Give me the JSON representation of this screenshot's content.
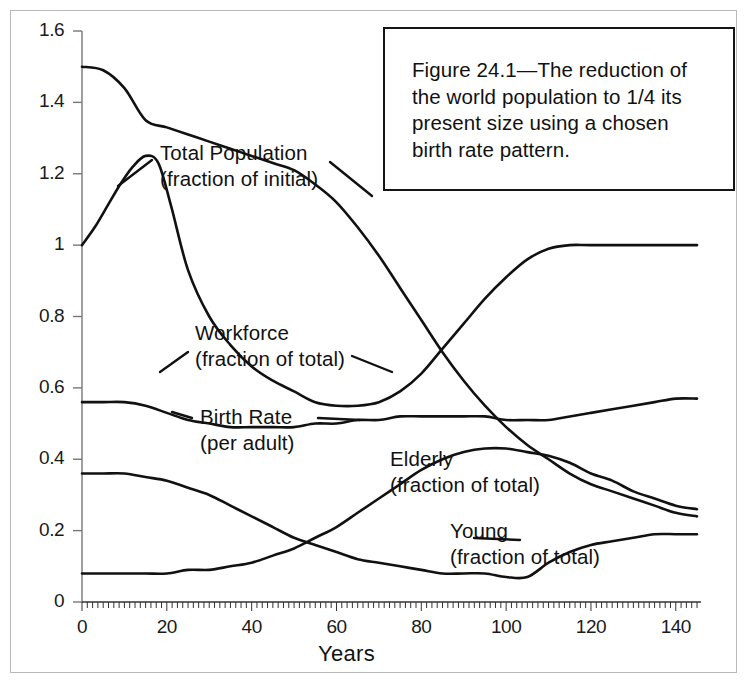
{
  "figure": {
    "caption_line1": "Figure 24.1—The reduction of",
    "caption_line2": "the world population to 1/4 its",
    "caption_line3": "present size using a chosen",
    "caption_line4": "birth rate pattern."
  },
  "annotations": [
    {
      "name": "total-population",
      "line1": "Total Population",
      "line2": "(fraction of initial)",
      "x": 160,
      "y": 140
    },
    {
      "name": "workforce",
      "line1": "Workforce",
      "line2": "(fraction of total)",
      "x": 195,
      "y": 320
    },
    {
      "name": "birth-rate",
      "line1": "Birth Rate",
      "line2": "(per adult)",
      "x": 200,
      "y": 404
    },
    {
      "name": "elderly",
      "line1": "Elderly",
      "line2": "(fraction of total)",
      "x": 390,
      "y": 446
    },
    {
      "name": "young",
      "line1": "Young",
      "line2": "(fraction of total)",
      "x": 450,
      "y": 518
    }
  ],
  "chart_data": {
    "type": "line",
    "title": "",
    "xlabel": "Years",
    "ylabel": "",
    "xlim": [
      0,
      145
    ],
    "ylim": [
      0,
      1.6
    ],
    "xticks": [
      0,
      20,
      40,
      60,
      80,
      100,
      120,
      140
    ],
    "yticks": [
      0,
      0.2,
      0.4,
      0.6,
      0.8,
      1,
      1.2,
      1.4,
      1.6
    ],
    "ytick_labels": [
      "0",
      "0.2",
      "0.4",
      "0.6",
      "0.8",
      "1",
      "1.2",
      "1.4",
      "1.6"
    ],
    "xtick_labels": [
      "0",
      "20",
      "40",
      "60",
      "80",
      "100",
      "120",
      "140"
    ],
    "grid": false,
    "legend": "inline-annotations",
    "line_color": "#111111",
    "series": [
      {
        "name": "Total Population (fraction of initial)",
        "x": [
          0,
          5,
          10,
          15,
          20,
          25,
          30,
          35,
          40,
          45,
          50,
          55,
          60,
          65,
          70,
          75,
          80,
          85,
          90,
          95,
          100,
          105,
          110,
          115,
          120,
          125,
          130,
          135,
          140,
          145
        ],
        "values": [
          1.5,
          1.49,
          1.44,
          1.35,
          1.33,
          1.31,
          1.29,
          1.27,
          1.25,
          1.23,
          1.21,
          1.17,
          1.12,
          1.05,
          0.97,
          0.88,
          0.79,
          0.7,
          0.62,
          0.55,
          0.49,
          0.44,
          0.4,
          0.36,
          0.33,
          0.31,
          0.29,
          0.27,
          0.25,
          0.24
        ]
      },
      {
        "name": "Birth Rate (per adult)",
        "x": [
          0,
          3,
          6,
          9,
          12,
          15,
          18,
          21,
          25,
          30,
          35,
          40,
          45,
          50,
          55,
          60,
          65,
          70,
          75,
          80,
          85,
          90,
          95,
          100,
          105,
          110,
          115,
          120,
          130,
          140,
          145
        ],
        "values": [
          1.0,
          1.05,
          1.11,
          1.17,
          1.22,
          1.25,
          1.23,
          1.11,
          0.93,
          0.8,
          0.72,
          0.66,
          0.62,
          0.59,
          0.56,
          0.55,
          0.55,
          0.56,
          0.59,
          0.64,
          0.71,
          0.78,
          0.85,
          0.91,
          0.96,
          0.99,
          1.0,
          1.0,
          1.0,
          1.0,
          1.0
        ]
      },
      {
        "name": "Workforce (fraction of total)",
        "x": [
          0,
          5,
          10,
          15,
          20,
          25,
          30,
          35,
          40,
          45,
          50,
          55,
          60,
          65,
          70,
          75,
          80,
          85,
          90,
          95,
          100,
          105,
          110,
          115,
          120,
          125,
          130,
          135,
          140,
          145
        ],
        "values": [
          0.56,
          0.56,
          0.56,
          0.55,
          0.53,
          0.51,
          0.5,
          0.49,
          0.49,
          0.49,
          0.49,
          0.5,
          0.5,
          0.51,
          0.51,
          0.52,
          0.52,
          0.52,
          0.52,
          0.52,
          0.51,
          0.51,
          0.51,
          0.52,
          0.53,
          0.54,
          0.55,
          0.56,
          0.57,
          0.57
        ]
      },
      {
        "name": "Elderly (fraction of total)",
        "x": [
          0,
          5,
          10,
          15,
          20,
          25,
          30,
          35,
          40,
          45,
          50,
          55,
          60,
          65,
          70,
          75,
          80,
          85,
          90,
          95,
          100,
          105,
          110,
          115,
          120,
          125,
          130,
          135,
          140,
          145
        ],
        "values": [
          0.08,
          0.08,
          0.08,
          0.08,
          0.08,
          0.09,
          0.09,
          0.1,
          0.11,
          0.13,
          0.15,
          0.18,
          0.21,
          0.25,
          0.29,
          0.33,
          0.37,
          0.4,
          0.42,
          0.43,
          0.43,
          0.42,
          0.41,
          0.39,
          0.36,
          0.34,
          0.31,
          0.29,
          0.27,
          0.26
        ]
      },
      {
        "name": "Young (fraction of total)",
        "x": [
          0,
          5,
          10,
          15,
          20,
          25,
          30,
          35,
          40,
          45,
          50,
          55,
          60,
          65,
          70,
          75,
          80,
          85,
          90,
          95,
          100,
          105,
          110,
          115,
          120,
          125,
          130,
          135,
          140,
          145
        ],
        "values": [
          0.36,
          0.36,
          0.36,
          0.35,
          0.34,
          0.32,
          0.3,
          0.27,
          0.24,
          0.21,
          0.18,
          0.16,
          0.14,
          0.12,
          0.11,
          0.1,
          0.09,
          0.08,
          0.08,
          0.08,
          0.07,
          0.07,
          0.11,
          0.14,
          0.16,
          0.17,
          0.18,
          0.19,
          0.19,
          0.19
        ]
      }
    ]
  }
}
